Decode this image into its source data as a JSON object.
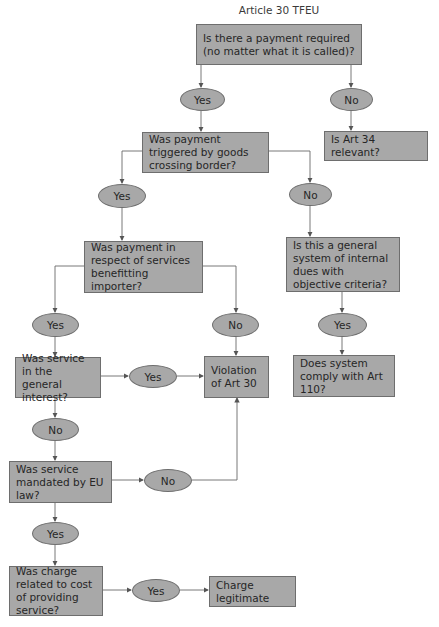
{
  "title": "Article 30 TFEU",
  "nodes": {
    "q_payment_required": "Is there a payment required (no matter what it is called)?",
    "q_triggered_border": "Was payment triggered by goods crossing border?",
    "art34": "Is Art 34 relevant?",
    "q_services_importer": "Was payment in respect of services benefitting importer?",
    "q_general_system": "Is this a general system of internal dues with objective criteria?",
    "q_general_interest": "Was service in the general interest?",
    "violation": "Violation of Art 30",
    "q_art110": "Does system comply with Art 110?",
    "q_mandated_eu": "Was service mandated by EU law?",
    "q_cost_related": "Was charge related to cost of providing service?",
    "legitimate": "Charge legitimate"
  },
  "answers": {
    "yes": "Yes",
    "no": "No"
  },
  "colors": {
    "fill": "#a8a8a8",
    "border": "#6e6e6e",
    "line": "#6a6a6a",
    "text": "#262626"
  }
}
